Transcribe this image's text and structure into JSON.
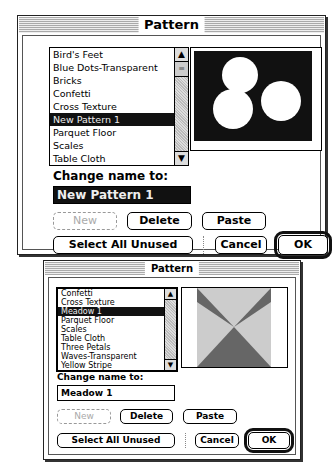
{
  "dialog_large": {
    "title": "Pattern",
    "list": {
      "items": [
        "Bird's Feet",
        "Blue Dots-Transparent",
        "Bricks",
        "Confetti",
        "Cross Texture",
        "New Pattern 1",
        "Parquet Floor",
        "Scales",
        "Table Cloth"
      ],
      "selected_index": 5
    },
    "scroll": {
      "up_icon": "▲",
      "down_icon": "▼",
      "thumb_icon": "≡"
    },
    "preview": {
      "description": "three white circles on black background",
      "bg": "#111111",
      "fg": "#ffffff"
    },
    "change_name_label": "Change name to:",
    "name_value": "New Pattern 1",
    "buttons": {
      "new": "New",
      "delete": "Delete",
      "paste": "Paste",
      "select_all_unused": "Select All Unused",
      "cancel": "Cancel",
      "ok": "OK"
    }
  },
  "dialog_small": {
    "title": "Pattern",
    "list": {
      "items": [
        "Confetti",
        "Cross Texture",
        "Meadow 1",
        "Parquet Floor",
        "Scales",
        "Table Cloth",
        "Three Petals",
        "Waves-Transparent",
        "Yellow Stripe"
      ],
      "selected_index": 2
    },
    "scroll": {
      "up_icon": "▲",
      "down_icon": "▼"
    },
    "preview": {
      "description": "hourglass/X shape pattern, dark gray triangles on light gray",
      "bg": "#cccccc",
      "fg": "#666666"
    },
    "change_name_label": "Change name to:",
    "name_value": "Meadow 1",
    "buttons": {
      "new": "New",
      "delete": "Delete",
      "paste": "Paste",
      "select_all_unused": "Select All Unused",
      "cancel": "Cancel",
      "ok": "OK"
    }
  }
}
